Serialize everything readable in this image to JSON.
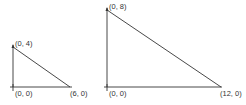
{
  "diagram": {
    "triangles": [
      {
        "name": "small-triangle",
        "vertices": {
          "origin": {
            "label": "(0, 0)",
            "px": [
              13,
              87
            ]
          },
          "top": {
            "label": "(0, 4)",
            "px": [
              13,
              47
            ]
          },
          "right": {
            "label": "(6, 0)",
            "px": [
              70,
              87
            ]
          }
        }
      },
      {
        "name": "large-triangle",
        "vertices": {
          "origin": {
            "label": "(0, 0)",
            "px": [
              107,
              87
            ]
          },
          "top": {
            "label": "(0, 8)",
            "px": [
              107,
              10
            ]
          },
          "right": {
            "label": "(12, 0)",
            "px": [
              221,
              87
            ]
          }
        }
      }
    ],
    "colors": {
      "stroke": "#333333",
      "background": "#ffffff"
    }
  }
}
